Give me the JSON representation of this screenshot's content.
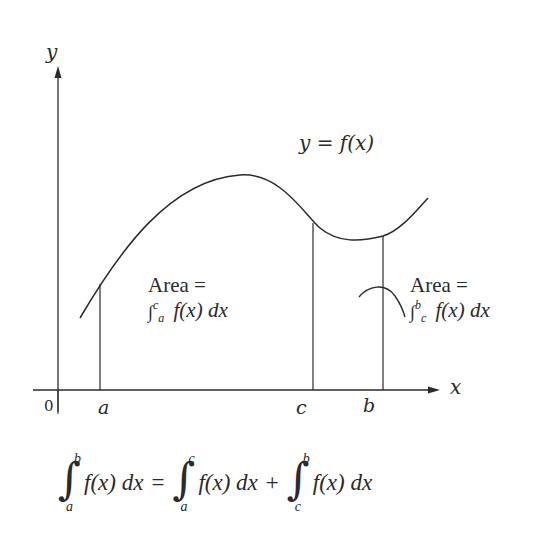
{
  "diagram": {
    "axes": {
      "x_label": "x",
      "y_label": "y",
      "origin_label": "0"
    },
    "curve_label": "y = f(x)",
    "points": [
      {
        "name": "a",
        "label": "a"
      },
      {
        "name": "c",
        "label": "c"
      },
      {
        "name": "b",
        "label": "b"
      }
    ],
    "left_area": {
      "line1": "Area =",
      "integral_upper": "c",
      "integral_lower": "a",
      "integrand": "f(x) dx"
    },
    "right_area": {
      "line1": "Area =",
      "integral_upper": "b",
      "integral_lower": "c",
      "integrand": "f(x) dx"
    },
    "equation": {
      "lhs": {
        "lower": "a",
        "upper": "b",
        "integrand": "f(x) dx"
      },
      "equals": "=",
      "rhs1": {
        "lower": "a",
        "upper": "c",
        "integrand": "f(x) dx"
      },
      "plus": "+",
      "rhs2": {
        "lower": "c",
        "upper": "b",
        "integrand": "f(x) dx"
      }
    },
    "colors": {
      "ink": "#2a2a2a",
      "background": "#ffffff"
    }
  }
}
